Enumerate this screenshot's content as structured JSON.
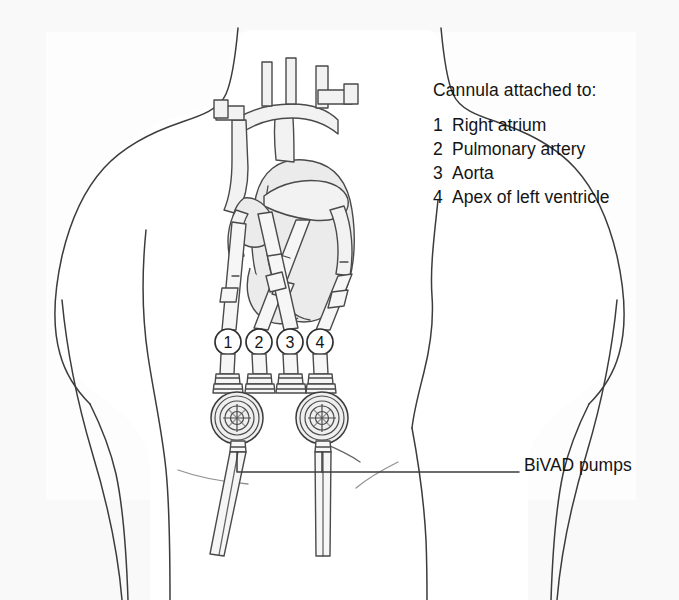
{
  "figure": {
    "background_color": "#fdfdfd",
    "ink_color": "#3a3a3a",
    "text_color": "#141414",
    "organ_fill": "#ececec",
    "tube_fill": "#f4f4f4"
  },
  "legend": {
    "heading": "Cannula attached to:",
    "items": [
      {
        "number": "1",
        "label": "Right atrium"
      },
      {
        "number": "2",
        "label": "Pulmonary artery"
      },
      {
        "number": "3",
        "label": "Aorta"
      },
      {
        "number": "4",
        "label": "Apex of left ventricle"
      }
    ]
  },
  "callout": {
    "pumps_label": "BiVAD pumps"
  },
  "markers": {
    "cannula_numbers": [
      "1",
      "2",
      "3",
      "4"
    ],
    "positions_x": [
      228,
      259,
      290,
      320
    ],
    "position_y": 342,
    "radius": 13
  },
  "anatomy": {
    "torso_label": "patient torso outline",
    "heart_label": "heart with great vessels",
    "aortic_arch_label": "aortic arch",
    "pump_count": 2
  }
}
